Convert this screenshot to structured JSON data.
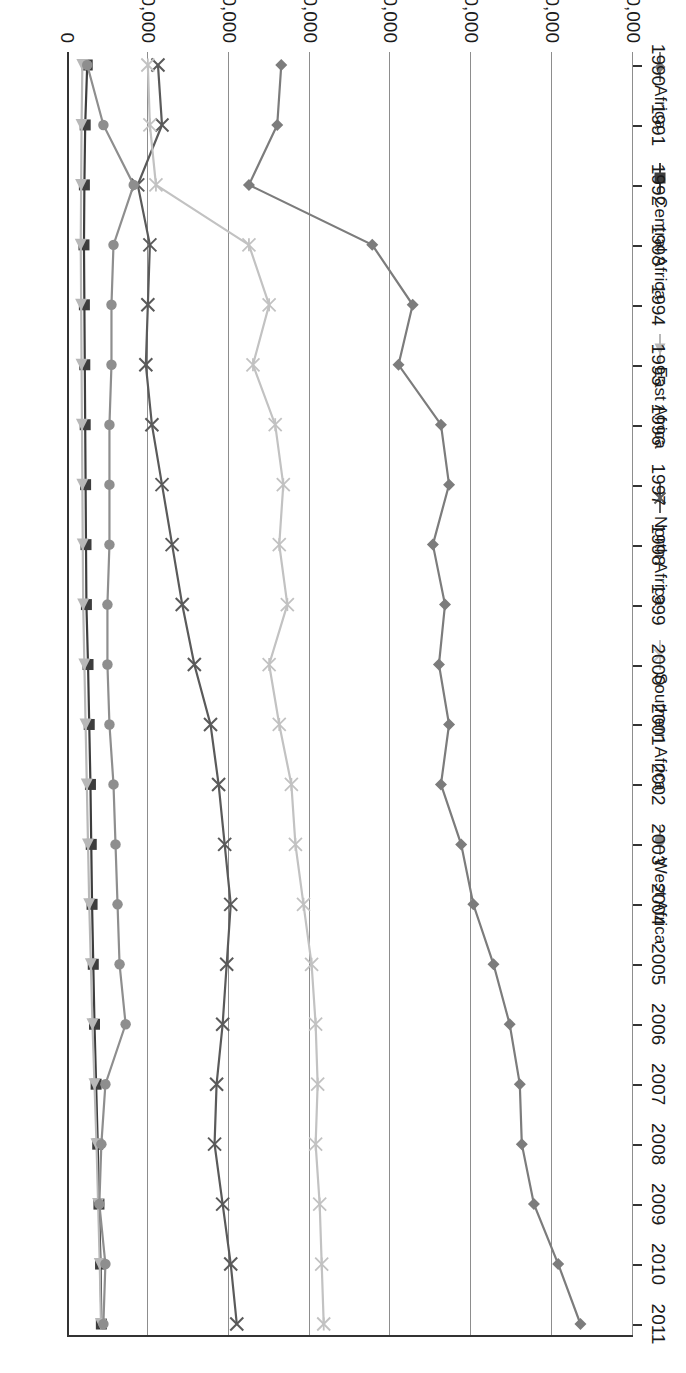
{
  "chart_data": {
    "type": "line",
    "title": "",
    "xlabel": "",
    "ylabel": "",
    "orientation": "page-rotated-90-clockwise",
    "grid": true,
    "legend_position": "top",
    "ylim": [
      0,
      140000
    ],
    "ytick_labels": [
      "0",
      "20,000",
      "40,000",
      "60,000",
      "80,000",
      "100,000",
      "120,000",
      "140,000"
    ],
    "ytick_values": [
      0,
      20000,
      40000,
      60000,
      80000,
      100000,
      120000,
      140000
    ],
    "categories": [
      "1990",
      "1991",
      "1992",
      "1993",
      "1994",
      "1995",
      "1996",
      "1997",
      "1998",
      "1999",
      "2000",
      "2001",
      "2002",
      "2003",
      "2004",
      "2005",
      "2006",
      "2007",
      "2008",
      "2009",
      "2010",
      "2011"
    ],
    "series": [
      {
        "name": "Africa",
        "marker": "diamond",
        "color": "#7c7c7c",
        "values": [
          53000,
          52000,
          45000,
          75500,
          85500,
          82000,
          92500,
          94500,
          90500,
          93500,
          92000,
          94500,
          92500,
          97500,
          100500,
          105500,
          109500,
          112000,
          112500,
          115500,
          121500,
          127000
        ]
      },
      {
        "name": "Central Africa",
        "marker": "square",
        "color": "#3d3d3d",
        "values": [
          5000,
          4500,
          4300,
          4200,
          4300,
          4400,
          4500,
          4600,
          4700,
          4800,
          5200,
          5500,
          5800,
          6000,
          6200,
          6500,
          6800,
          7200,
          7600,
          7900,
          8300,
          8500
        ]
      },
      {
        "name": "East Africa",
        "marker": "triangle",
        "color": "#b8b8b8",
        "values": [
          3800,
          3600,
          3500,
          3400,
          3500,
          3600,
          3700,
          3800,
          3900,
          4000,
          4300,
          4600,
          4900,
          5200,
          5500,
          5900,
          6300,
          6800,
          7300,
          7700,
          8100,
          8400
        ]
      },
      {
        "name": "North Africa",
        "marker": "x",
        "color": "#5a5a5a",
        "values": [
          22500,
          23500,
          17500,
          20500,
          20000,
          19500,
          21000,
          23500,
          26000,
          28500,
          31500,
          35500,
          37500,
          39000,
          40500,
          39500,
          38500,
          37000,
          36500,
          38500,
          40500,
          42000
        ]
      },
      {
        "name": "Southern Africa",
        "marker": "asterisk",
        "color": "#c2c2c2",
        "values": [
          20000,
          20500,
          22000,
          45000,
          50000,
          46000,
          51500,
          53500,
          52500,
          54500,
          50000,
          52500,
          55500,
          56500,
          58500,
          60500,
          61500,
          62000,
          61500,
          62500,
          63000,
          63500
        ]
      },
      {
        "name": "West Africa",
        "marker": "circle",
        "color": "#8e8e8e",
        "values": [
          5000,
          9000,
          16500,
          11500,
          11000,
          11000,
          10500,
          10500,
          10500,
          10000,
          10000,
          10500,
          11500,
          12000,
          12500,
          13000,
          14500,
          9500,
          8500,
          8000,
          9500,
          9000
        ]
      }
    ]
  },
  "legend": {
    "items": [
      {
        "label": "Africa",
        "marker": "diamond",
        "color": "#7c7c7c"
      },
      {
        "label": "Central Africa",
        "marker": "square",
        "color": "#3d3d3d"
      },
      {
        "label": "East Africa",
        "marker": "triangle",
        "color": "#b8b8b8"
      },
      {
        "label": "North Africa",
        "marker": "x",
        "color": "#5a5a5a"
      },
      {
        "label": "Southern Africa",
        "marker": "asterisk",
        "color": "#c2c2c2"
      },
      {
        "label": "West Africa",
        "marker": "circle",
        "color": "#8e8e8e"
      }
    ]
  }
}
